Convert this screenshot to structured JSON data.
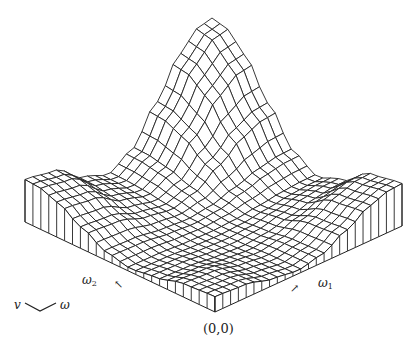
{
  "figure": {
    "type": "3d-wireframe-surface",
    "origin_label": "(0,0)",
    "axis1": {
      "symbol": "ω",
      "sub": "1",
      "arrow": "↗"
    },
    "axis2": {
      "symbol": "ω",
      "sub": "2",
      "arrow": "↖"
    },
    "legend": {
      "left": "v",
      "right": "ω"
    },
    "line_color": "#222222",
    "background": "#ffffff",
    "grid_lines": 24
  },
  "chart_data": {
    "type": "surface",
    "title": "",
    "xlabel": "ω1",
    "ylabel": "ω2",
    "x_range": [
      0,
      3.14159
    ],
    "y_range": [
      0,
      3.14159
    ],
    "origin_screen": [
      215,
      312
    ],
    "axis1_screen_vector": [
      187,
      -86
    ],
    "axis2_screen_vector": [
      -190,
      -90
    ],
    "height_scale": 118,
    "profile_points": [
      [
        0,
        0.36
      ],
      [
        0.5,
        0.32
      ],
      [
        1.0,
        0.15
      ],
      [
        1.4,
        0.08
      ],
      [
        1.8,
        0.2
      ],
      [
        2.2,
        0.5
      ],
      [
        2.6,
        0.82
      ],
      [
        2.9,
        0.97
      ],
      [
        3.14159,
        1.0
      ]
    ],
    "peak": {
      "omega1": 3.14159,
      "omega2": 3.14159,
      "relative_height": 1.0
    }
  }
}
